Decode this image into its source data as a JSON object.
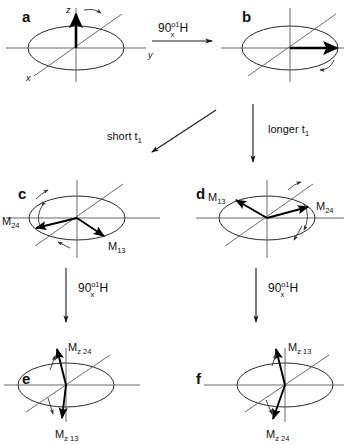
{
  "figure": {
    "background_color": "#fefefe",
    "line_color": "#2a2a2a"
  },
  "panels": [
    {
      "id": "a",
      "letter": "a",
      "axes": {
        "z": "z",
        "y": "y",
        "x": "x"
      },
      "vectors": [],
      "description": "equilibrium magnetization along +z"
    },
    {
      "id": "b",
      "letter": "b",
      "axes": {
        "z": "",
        "y": "",
        "x": ""
      },
      "vectors": [],
      "description": "magnetization rotated into transverse plane along +y"
    },
    {
      "id": "c",
      "letter": "c",
      "vectors": [
        {
          "name": "M24",
          "base": "M",
          "sub": "24"
        },
        {
          "name": "M13",
          "base": "M",
          "sub": "13"
        }
      ],
      "description": "short t1 evolution, doublet vectors slightly diverged"
    },
    {
      "id": "d",
      "letter": "d",
      "vectors": [
        {
          "name": "M13",
          "base": "M",
          "sub": "13"
        },
        {
          "name": "M24",
          "base": "M",
          "sub": "24"
        }
      ],
      "description": "longer t1 evolution, doublet vectors widely diverged"
    },
    {
      "id": "e",
      "letter": "e",
      "vectors": [
        {
          "name": "Mz24",
          "base": "M",
          "sub": "z 24"
        },
        {
          "name": "Mz13",
          "base": "M",
          "sub": "z 13"
        }
      ],
      "description": "after second pulse, Mz24 up and Mz13 down"
    },
    {
      "id": "f",
      "letter": "f",
      "vectors": [
        {
          "name": "Mz13",
          "base": "M",
          "sub": "z 13"
        },
        {
          "name": "Mz24",
          "base": "M",
          "sub": "z 24"
        }
      ],
      "description": "after second pulse, Mz13 up and Mz24 down"
    }
  ],
  "operations": [
    {
      "id": "pulse-a-b",
      "number": "90",
      "degree": "o",
      "axis": "x",
      "nucleus_superscript": "1",
      "nucleus": "H",
      "direction": "right"
    },
    {
      "id": "delay-short",
      "label": "short t",
      "subscript": "1",
      "direction": "down-left"
    },
    {
      "id": "delay-longer",
      "label": "longer t",
      "subscript": "1",
      "direction": "down"
    },
    {
      "id": "pulse-c-e",
      "number": "90",
      "degree": "o",
      "axis": "x",
      "nucleus_superscript": "1",
      "nucleus": "H",
      "direction": "down"
    },
    {
      "id": "pulse-d-f",
      "number": "90",
      "degree": "o",
      "axis": "x",
      "nucleus_superscript": "1",
      "nucleus": "H",
      "direction": "down"
    }
  ]
}
